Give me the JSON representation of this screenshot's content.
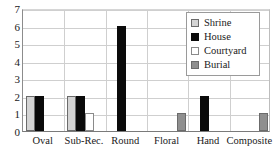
{
  "chart_data": {
    "type": "bar",
    "title": "",
    "xlabel": "",
    "ylabel": "",
    "ylim": [
      0,
      7
    ],
    "ytick_labels": [
      "7",
      "6",
      "5",
      "4",
      "3",
      "2",
      "1",
      "0"
    ],
    "yticks": [
      7,
      6,
      5,
      4,
      3,
      2,
      1,
      0
    ],
    "grid": true,
    "legend_position": "upper-right",
    "categories": [
      "Oval",
      "Sub-Rec.",
      "Round",
      "Floral",
      "Hand",
      "Composite"
    ],
    "series": [
      {
        "name": "Shrine",
        "color": "#d4d4d4",
        "values": [
          2,
          2,
          0,
          0,
          0,
          0
        ]
      },
      {
        "name": "House",
        "color": "#0a0a0a",
        "values": [
          2,
          2,
          6,
          0,
          2,
          0
        ]
      },
      {
        "name": "Courtyard",
        "color": "#ffffff",
        "values": [
          0,
          1,
          0,
          0,
          0,
          0
        ]
      },
      {
        "name": "Burial",
        "color": "#8f8f8f",
        "values": [
          0,
          0,
          0,
          1,
          0,
          1
        ]
      }
    ]
  },
  "legend": {
    "items": [
      {
        "label": "Shrine",
        "swatch": "shrine"
      },
      {
        "label": "House",
        "swatch": "house"
      },
      {
        "label": "Courtyard",
        "swatch": "courtyard"
      },
      {
        "label": "Burial",
        "swatch": "burial"
      }
    ]
  },
  "colors": {
    "shrine": "#d4d4d4",
    "house": "#0a0a0a",
    "courtyard": "#ffffff",
    "burial": "#8f8f8f",
    "axis": "#7a7a7a",
    "grid": "#cfcfcf",
    "text": "#1a1a1a"
  }
}
